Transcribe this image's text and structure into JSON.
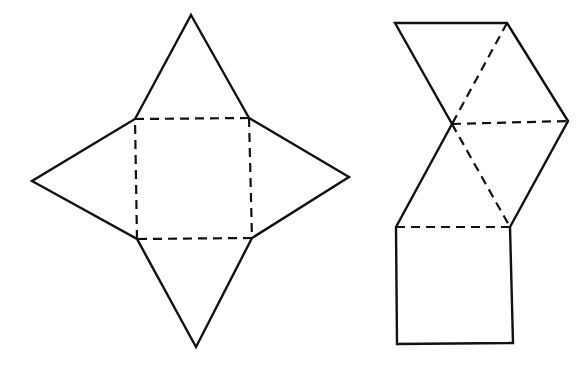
{
  "figure": {
    "stroke_color": "#111111",
    "background": "#ffffff",
    "nets": [
      {
        "name": "star-net",
        "base_square": [
          [
            135,
            119
          ],
          [
            249,
            118
          ],
          [
            252,
            238
          ],
          [
            137,
            239
          ]
        ],
        "apexes": {
          "top": [
            191,
            15
          ],
          "right": [
            349,
            177
          ],
          "bottom": [
            196,
            347
          ],
          "left": [
            32,
            181
          ]
        },
        "fold_lines": "dashed square base"
      },
      {
        "name": "zigzag-net",
        "vertices": {
          "top_left": [
            395,
            23
          ],
          "top_right": [
            507,
            23
          ],
          "mid_left": [
            452,
            124
          ],
          "mid_right": [
            568,
            121
          ],
          "square_top_left": [
            396,
            227
          ],
          "square_top_right": [
            510,
            227
          ],
          "square_bottom_left": [
            397,
            344
          ],
          "square_bottom_right": [
            513,
            343
          ]
        },
        "fold_lines": "dashed diagonals and square top edge"
      }
    ]
  }
}
